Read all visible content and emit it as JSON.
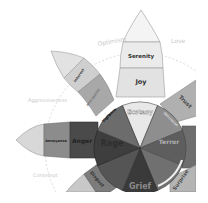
{
  "diagram": {
    "center": [
      140,
      148
    ],
    "dyads": {
      "optimism": "Optimism",
      "love": "Love",
      "aggressiveness": "Aggressiveness",
      "contempt": "Contempt"
    },
    "petals": {
      "joy": {
        "outer": "Serenity",
        "middle": "Joy",
        "inner": "Ecstasy",
        "outer_color": "#ebebeb",
        "middle_color": "#e0e0e0",
        "inner_color": "#d0d0d0"
      },
      "trust": {
        "outer": "Acceptance",
        "middle": "Trust",
        "inner": "Admiration",
        "outer_color": "#c8c8c8",
        "middle_color": "#a8a8a8",
        "inner_color": "#8a8a8a"
      },
      "fear": {
        "outer": "Apprehension",
        "middle": "Fear",
        "inner": "Terror",
        "outer_color": "#8c8c8c",
        "middle_color": "#6e6e6e",
        "inner_color": "#5c5c5c"
      },
      "surprise": {
        "outer": "Distraction",
        "middle": "Surprise",
        "inner": "Amazement",
        "outer_color": "#b4b4b4",
        "middle_color": "#9a9a9a",
        "inner_color": "#6a6a6a"
      },
      "sadness": {
        "outer": "Pensiveness",
        "middle": "Sadness",
        "inner": "Grief",
        "outer_color": "#7a7a7a",
        "middle_color": "#555555",
        "inner_color": "#3a3a3a"
      },
      "disgust": {
        "outer": "Boredom",
        "middle": "Disgust",
        "inner": "Loathing",
        "outer_color": "#bdbdbd",
        "middle_color": "#8a8a8a",
        "inner_color": "#4f4f4f"
      },
      "anger": {
        "outer": "Annoyance",
        "middle": "Anger",
        "inner": "Rage",
        "outer_color": "#b8b8b8",
        "middle_color": "#7c7c7c",
        "inner_color": "#3c3c3c"
      },
      "anticipation": {
        "outer": "Interest",
        "middle": "Anticipation",
        "inner": "Vigilance",
        "outer_color": "#d4d4d4",
        "middle_color": "#a6a6a6",
        "inner_color": "#6e6e6e"
      }
    }
  }
}
